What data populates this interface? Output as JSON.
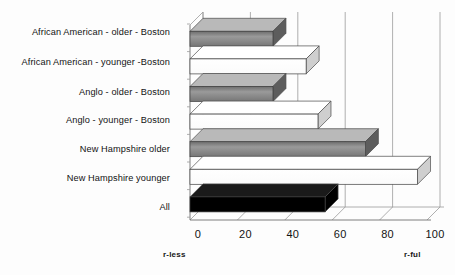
{
  "chart_data": {
    "type": "bar",
    "orientation": "horizontal",
    "title": "",
    "xlabel": "",
    "ylabel": "",
    "xlim": [
      0,
      100
    ],
    "xticks": [
      0,
      20,
      40,
      60,
      80,
      100
    ],
    "grid": true,
    "legend": false,
    "axis_end_labels": {
      "left": "r-less",
      "right": "r-ful"
    },
    "categories": [
      "African American - older - Boston",
      "African American - younger -Boston",
      "Anglo - older - Boston",
      "Anglo - younger - Boston",
      "New Hampshire older",
      "New Hampshire younger",
      "All"
    ],
    "values": [
      35,
      49,
      35,
      54,
      74,
      96,
      57
    ],
    "bar_fills": [
      "#8c8c8c",
      "#ffffff",
      "#8c8c8c",
      "#ffffff",
      "#8c8c8c",
      "#ffffff",
      "#000000"
    ],
    "style": "3d-perspective",
    "colors": {
      "gray_bar": "#8c8c8c",
      "white_bar": "#ffffff",
      "black_bar": "#000000",
      "gridline": "#9a9a9a",
      "axis": "#6f6f6f",
      "text": "#131313",
      "background": "#fdfdfd"
    }
  }
}
